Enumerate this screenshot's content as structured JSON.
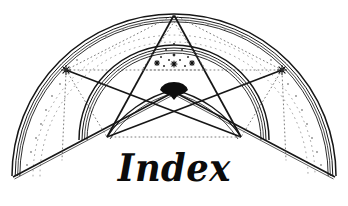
{
  "page": {
    "width": 348,
    "height": 206,
    "background_color": "#ffffff",
    "ink_color": "#161616",
    "faint_ink_color": "#8a8a8a"
  },
  "title": {
    "text": "Index",
    "style": "blackletter",
    "color": "#0b0b0b"
  },
  "emblem": {
    "name": "arched-pentagram-emblem",
    "description": "Semicircular arch with inscribed pentagram and inner arches",
    "outer_arch": {
      "center_x": 174,
      "center_y": 176,
      "radius_outer": 162,
      "band_radii": [
        162,
        159,
        156.5,
        154.5
      ],
      "start_angle_deg": 180,
      "end_angle_deg": 360
    },
    "base_line": {
      "left_x": 13,
      "left_y": 176,
      "apex_x": 174,
      "apex_y": 92,
      "right_x": 335,
      "right_y": 176
    },
    "inner_arch": {
      "center_x": 174,
      "center_y": 140,
      "band_radii": [
        95,
        92,
        89.5,
        87
      ],
      "start_angle_deg": 180,
      "end_angle_deg": 360
    },
    "pentagram": {
      "apex_top": {
        "x": 174,
        "y": 15
      },
      "left_point": {
        "x": 66,
        "y": 70
      },
      "right_point": {
        "x": 282,
        "y": 70
      },
      "left_lower": {
        "x": 107,
        "y": 137
      },
      "right_lower": {
        "x": 241,
        "y": 137
      },
      "center_node": {
        "x": 174,
        "y": 92
      }
    },
    "markers": [
      {
        "name": "star-marker-left",
        "x": 66,
        "y": 70
      },
      {
        "name": "star-marker-right",
        "x": 282,
        "y": 70
      }
    ],
    "inner_triangle_dots": [
      {
        "x": 174,
        "y": 44,
        "r": 1.1
      },
      {
        "x": 166,
        "y": 50,
        "r": 1.0
      },
      {
        "x": 182,
        "y": 50,
        "r": 1.0
      },
      {
        "x": 174,
        "y": 55,
        "r": 1.4
      },
      {
        "x": 161,
        "y": 57,
        "r": 1.0
      },
      {
        "x": 188,
        "y": 57,
        "r": 1.0
      },
      {
        "x": 169,
        "y": 60,
        "r": 1.0
      },
      {
        "x": 180,
        "y": 60,
        "r": 1.0
      },
      {
        "x": 157,
        "y": 63,
        "r": 1.3
      },
      {
        "x": 174,
        "y": 64,
        "r": 1.5
      },
      {
        "x": 192,
        "y": 63,
        "r": 1.3
      },
      {
        "x": 164,
        "y": 66,
        "r": 1.0
      },
      {
        "x": 185,
        "y": 66,
        "r": 1.0
      }
    ],
    "arc_dot_trail": {
      "description": "faint dotted arc following inside of outer band",
      "radius": 146,
      "count": 46
    },
    "center_cap": {
      "name": "solid-black-keystone",
      "x": 174,
      "y": 88,
      "width": 30,
      "height": 12
    }
  }
}
